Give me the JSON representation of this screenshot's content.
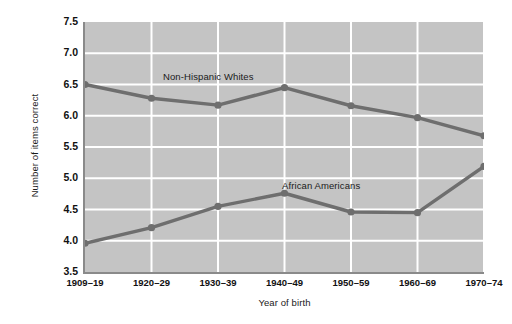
{
  "chart_data": {
    "type": "line",
    "title": "",
    "xlabel": "Year of birth",
    "ylabel": "Number of items correct",
    "categories": [
      "1909–19",
      "1920–29",
      "1930–39",
      "1940–49",
      "1950–59",
      "1960–69",
      "1970–74"
    ],
    "ylim": [
      3.5,
      7.5
    ],
    "yticks": [
      "7.5",
      "7.0",
      "6.5",
      "6.0",
      "5.5",
      "5.0",
      "4.5",
      "4.0",
      "3.5"
    ],
    "ytick_values": [
      7.5,
      7.0,
      6.5,
      6.0,
      5.5,
      5.0,
      4.5,
      4.0,
      3.5
    ],
    "grid": true,
    "grid_color": "#ffffff",
    "plot_background": "#c4c4c4",
    "series_color": "#6e6e6e",
    "legend_position": "inline-annotation",
    "series": [
      {
        "name": "Non-Hispanic Whites",
        "values": [
          6.5,
          6.28,
          6.17,
          6.45,
          6.16,
          5.97,
          5.68
        ]
      },
      {
        "name": "African Americans",
        "values": [
          3.96,
          4.21,
          4.55,
          4.76,
          4.46,
          4.45,
          5.19
        ]
      }
    ],
    "annotations": [
      {
        "text": "Non-Hispanic Whites",
        "series": "Non-Hispanic Whites"
      },
      {
        "text": "African Americans",
        "series": "African Americans"
      }
    ]
  }
}
